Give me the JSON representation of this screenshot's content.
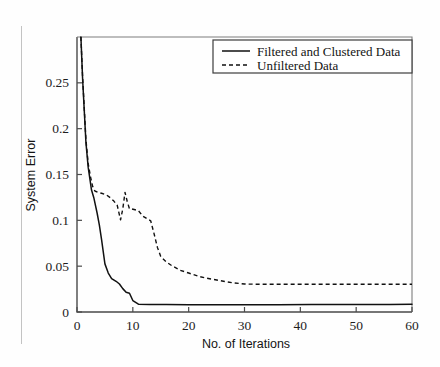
{
  "chart_data": {
    "type": "line",
    "title": "",
    "xlabel": "No. of Iterations",
    "ylabel": "System Error",
    "xlim": [
      0,
      60
    ],
    "ylim": [
      0,
      0.3
    ],
    "xticks": [
      0,
      10,
      20,
      30,
      40,
      50,
      60
    ],
    "xtick_labels": [
      "0",
      "10",
      "20",
      "30",
      "40",
      "50",
      "60"
    ],
    "yticks": [
      0,
      0.05,
      0.1,
      0.15,
      0.2,
      0.25
    ],
    "ytick_labels": [
      "0",
      "0.05",
      "0.1",
      "0.15",
      "0.2",
      "0.25"
    ],
    "grid": false,
    "legend_position": "upper right",
    "series": [
      {
        "name": "Filtered and Clustered Data",
        "style": "solid",
        "color": "#111111",
        "x": [
          0.7,
          1.0,
          1.6,
          2.0,
          2.6,
          3.0,
          3.6,
          4.0,
          4.4,
          5.0,
          5.6,
          6.2,
          7.0,
          7.6,
          8.2,
          8.8,
          9.4,
          10.0,
          11.0,
          13.0,
          16.0,
          20.0,
          25.0,
          30.0,
          36.0,
          42.0,
          50.0,
          56.0,
          60.0
        ],
        "y": [
          0.3,
          0.255,
          0.185,
          0.158,
          0.133,
          0.125,
          0.108,
          0.095,
          0.079,
          0.0525,
          0.0425,
          0.0365,
          0.0335,
          0.0305,
          0.0255,
          0.0215,
          0.0205,
          0.0125,
          0.0085,
          0.0082,
          0.0081,
          0.008,
          0.008,
          0.008,
          0.008,
          0.0081,
          0.0081,
          0.0082,
          0.0084
        ]
      },
      {
        "name": "Unfiltered Data",
        "style": "dashed",
        "color": "#111111",
        "x": [
          0.7,
          1.0,
          1.6,
          2.0,
          2.4,
          2.8,
          3.2,
          3.8,
          4.4,
          5.2,
          6.0,
          6.6,
          7.2,
          7.8,
          8.2,
          8.6,
          9.0,
          9.4,
          9.8,
          10.4,
          11.0,
          11.8,
          12.6,
          13.2,
          13.8,
          14.4,
          15.0,
          16.0,
          17.0,
          18.5,
          20.0,
          22.0,
          24.0,
          26.0,
          28.0,
          30.0,
          34.0,
          40.0,
          46.0,
          52.0,
          60.0
        ],
        "y": [
          0.3,
          0.257,
          0.188,
          0.162,
          0.148,
          0.137,
          0.132,
          0.1305,
          0.1295,
          0.128,
          0.1245,
          0.121,
          0.1165,
          0.1005,
          0.1125,
          0.1305,
          0.1205,
          0.1125,
          0.1125,
          0.1115,
          0.1105,
          0.1045,
          0.1015,
          0.0995,
          0.0855,
          0.0705,
          0.0605,
          0.0545,
          0.0505,
          0.0455,
          0.0425,
          0.0385,
          0.036,
          0.0338,
          0.0318,
          0.0305,
          0.0302,
          0.0302,
          0.0302,
          0.0302,
          0.0303
        ]
      }
    ]
  },
  "legend": {
    "entries": [
      {
        "label": "Filtered and Clustered Data",
        "style": "solid"
      },
      {
        "label": "Unfiltered Data",
        "style": "dashed"
      }
    ]
  },
  "axes": {
    "x_title": "No. of Iterations",
    "y_title": "System Error"
  }
}
